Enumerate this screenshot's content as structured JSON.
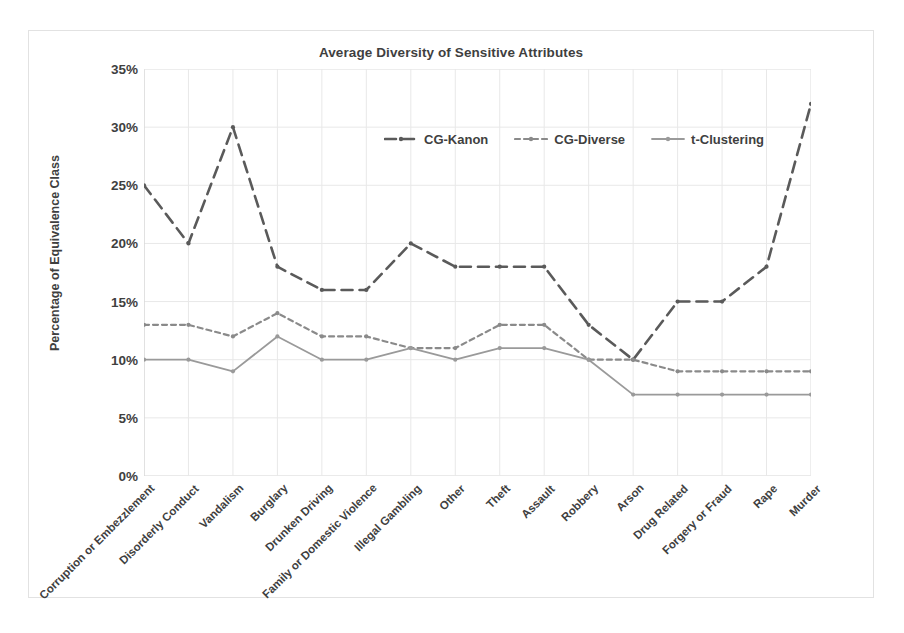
{
  "chart_data": {
    "type": "line",
    "title": "Average Diversity of Sensitive Attributes",
    "xlabel": "",
    "ylabel": "Percentage of Equivalence Class",
    "ylim": [
      0,
      35
    ],
    "ytick_labels": [
      "0%",
      "5%",
      "10%",
      "15%",
      "20%",
      "25%",
      "30%",
      "35%"
    ],
    "ytick_values": [
      0,
      5,
      10,
      15,
      20,
      25,
      30,
      35
    ],
    "grid": true,
    "legend_position": "top-center-inside",
    "categories": [
      "Corruption or Embezzlement",
      "Disorderly Conduct",
      "Vandalism",
      "Burglary",
      "Drunken Driving",
      "Family or Domestic Violence",
      "Illegal Gambling",
      "Other",
      "Theft",
      "Assault",
      "Robbery",
      "Arson",
      "Drug Related",
      "Forgery or Fraud",
      "Rape",
      "Murder"
    ],
    "series": [
      {
        "name": "CG-Kanon",
        "style": "long-dash",
        "color": "#5a5a5a",
        "values": [
          25,
          20,
          30,
          18,
          16,
          16,
          20,
          18,
          18,
          18,
          13,
          10,
          15,
          15,
          18,
          32
        ]
      },
      {
        "name": "CG-Diverse",
        "style": "short-dash",
        "color": "#8a8a8a",
        "values": [
          13,
          13,
          12,
          14,
          12,
          12,
          11,
          11,
          13,
          13,
          10,
          10,
          9,
          9,
          9,
          9
        ]
      },
      {
        "name": "t-Clustering",
        "style": "solid",
        "color": "#9a9a9a",
        "values": [
          10,
          10,
          9,
          12,
          10,
          10,
          11,
          10,
          11,
          11,
          10,
          7,
          7,
          7,
          7,
          7
        ]
      }
    ]
  },
  "colors": {
    "frame_border": "#e2e2e2",
    "grid": "#e8e8e8",
    "axis": "#d6d6d6",
    "text": "#3f3f3f"
  }
}
